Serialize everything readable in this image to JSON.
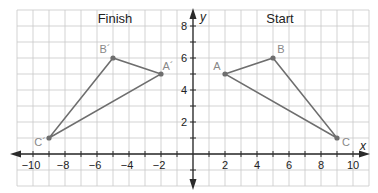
{
  "chart_data": {
    "type": "scatter",
    "title": "",
    "xlabel": "x",
    "ylabel": "y",
    "xlim": [
      -11,
      11
    ],
    "ylim": [
      -2,
      9
    ],
    "grid": true,
    "x_ticks": [
      -10,
      -8,
      -6,
      -4,
      -2,
      2,
      4,
      6,
      8,
      10
    ],
    "y_ticks": [
      2,
      4,
      6,
      8
    ],
    "annotations": [
      "Finish",
      "Start"
    ],
    "series": [
      {
        "name": "Start",
        "shape": "triangle",
        "points": [
          {
            "label": "A",
            "x": 2,
            "y": 5
          },
          {
            "label": "B",
            "x": 5,
            "y": 6
          },
          {
            "label": "C",
            "x": 9,
            "y": 1
          }
        ]
      },
      {
        "name": "Finish",
        "shape": "triangle",
        "points": [
          {
            "label": "A´",
            "x": -2,
            "y": 5
          },
          {
            "label": "B´",
            "x": -5,
            "y": 6
          },
          {
            "label": "C´",
            "x": -9,
            "y": 1
          }
        ]
      }
    ]
  },
  "labels": {
    "finish_title": "Finish",
    "start_title": "Start",
    "x_axis": "x",
    "y_axis": "y"
  },
  "colors": {
    "grid": "#c8c8c8",
    "axis": "#2a2a2a",
    "triangle": "#6e6e6e",
    "point_label": "#888888"
  }
}
